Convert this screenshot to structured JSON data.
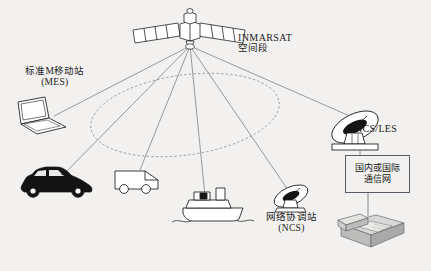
{
  "diagram": {
    "background_color": "#f2f1ef",
    "line_color": "#6b6b78",
    "stroke_color": "#1a1a1a",
    "labels": {
      "inmarsat_line1": "INMARSAT",
      "inmarsat_line2": "空间段",
      "mes_line1": "标准M移动站",
      "mes_line2": "(MES)",
      "ncs_les": "NCS/LES",
      "ncs_line1": "网络协调站",
      "ncs_line2": "(NCS)",
      "network_line1": "国内或国际",
      "network_line2": "通信网"
    },
    "nodes": [
      {
        "id": "satellite",
        "name": "inmarsat-satellite",
        "label": "INMARSAT 空间段"
      },
      {
        "id": "laptop",
        "name": "laptop-terminal",
        "label": "标准M移动站 (MES)"
      },
      {
        "id": "car",
        "name": "car-mobile-station",
        "label": "标准M移动站 (MES)"
      },
      {
        "id": "van",
        "name": "van-mobile-station",
        "label": "标准M移动站 (MES)"
      },
      {
        "id": "ship",
        "name": "ship-mobile-station",
        "label": "标准M移动站 (MES)"
      },
      {
        "id": "ncs-dish",
        "name": "ncs-ground-station",
        "label": "网络协调站 (NCS)"
      },
      {
        "id": "les-dish",
        "name": "ncs-les-earth-station",
        "label": "NCS/LES"
      },
      {
        "id": "network-box",
        "name": "telecom-network-box",
        "label": "国内或国际 通信网"
      },
      {
        "id": "telephone",
        "name": "telephone-fax-terminal",
        "label": "telephone"
      },
      {
        "id": "coverage",
        "name": "coverage-footprint-ellipse",
        "label": "satellite beam footprint"
      }
    ],
    "links": [
      {
        "from": "satellite",
        "to": "laptop"
      },
      {
        "from": "satellite",
        "to": "car"
      },
      {
        "from": "satellite",
        "to": "van"
      },
      {
        "from": "satellite",
        "to": "ship"
      },
      {
        "from": "satellite",
        "to": "ncs-dish"
      },
      {
        "from": "satellite",
        "to": "les-dish"
      },
      {
        "from": "les-dish",
        "to": "network-box"
      },
      {
        "from": "network-box",
        "to": "telephone"
      }
    ]
  }
}
